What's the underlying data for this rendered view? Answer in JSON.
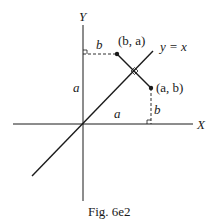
{
  "figure": {
    "caption": "Fig. 6e2",
    "axes": {
      "x_label": "X",
      "y_label": "Y"
    },
    "line_label": "y = x",
    "points": [
      {
        "label": "(b, a)"
      },
      {
        "label": "(a, b)"
      }
    ],
    "segment_labels": {
      "top_horizontal": "b",
      "left_vertical": "a",
      "bottom_horizontal": "a",
      "right_vertical": "b"
    },
    "colors": {
      "ink": "#1a1a1a",
      "background": "#ffffff"
    }
  }
}
